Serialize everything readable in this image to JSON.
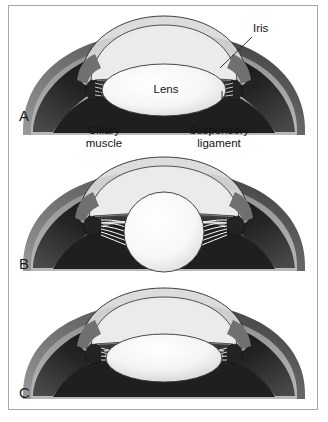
{
  "figure": {
    "border_color": "#a8a8a8",
    "background": "#ffffff",
    "width": 328,
    "height": 422
  },
  "palette": {
    "cornea_outer": "#d6d6d6",
    "cornea_inner": "#e6e6e6",
    "aqueous": "#efefef",
    "sclera_light": "#b4b4b4",
    "sclera_mid": "#8a8a8a",
    "choroid_dark": "#2a2a2a",
    "iris_dark": "#3a3a3a",
    "iris_mid": "#5e5e5e",
    "lens_white": "#fbfbfb",
    "lens_shade": "#d2d2d2",
    "zonule": "#f2f2f2",
    "outline": "#1e1e1e",
    "label_text": "#141414",
    "leader_line": "#1e1e1e"
  },
  "panels": [
    {
      "id": "panel-a",
      "letter": "A",
      "letter_x": 10,
      "letter_y": 108,
      "state": "unaccommodated-flat-lens",
      "lens_rx": 62,
      "lens_ry": 26,
      "labels": [
        {
          "name": "iris",
          "text": "Iris",
          "x": 244,
          "y": 22,
          "align": "left",
          "leader": {
            "x1": 243,
            "y1": 31,
            "x2": 211,
            "y2": 62
          }
        },
        {
          "name": "lens",
          "text": "Lens",
          "x": 139,
          "y": 83,
          "align": "center",
          "leader": null
        },
        {
          "name": "ciliary-muscle",
          "text": "Ciliary\nmuscle",
          "x": 73,
          "y": 123,
          "align": "center",
          "leader": {
            "x1": 103,
            "y1": 121,
            "x2": 90,
            "y2": 83
          }
        },
        {
          "name": "suspensory-ligament",
          "text": "Suspensory\nligament",
          "x": 185,
          "y": 123,
          "align": "center",
          "leader": {
            "x1": 213,
            "y1": 121,
            "x2": 213,
            "y2": 85
          }
        }
      ]
    },
    {
      "id": "panel-b",
      "letter": "B",
      "letter_x": 10,
      "letter_y": 256,
      "state": "accommodated-round-lens",
      "lens_rx": 40,
      "lens_ry": 40,
      "labels": []
    },
    {
      "id": "panel-c",
      "letter": "C",
      "letter_x": 10,
      "letter_y": 386,
      "state": "intermediate-lens",
      "lens_rx": 58,
      "lens_ry": 24,
      "labels": []
    }
  ]
}
